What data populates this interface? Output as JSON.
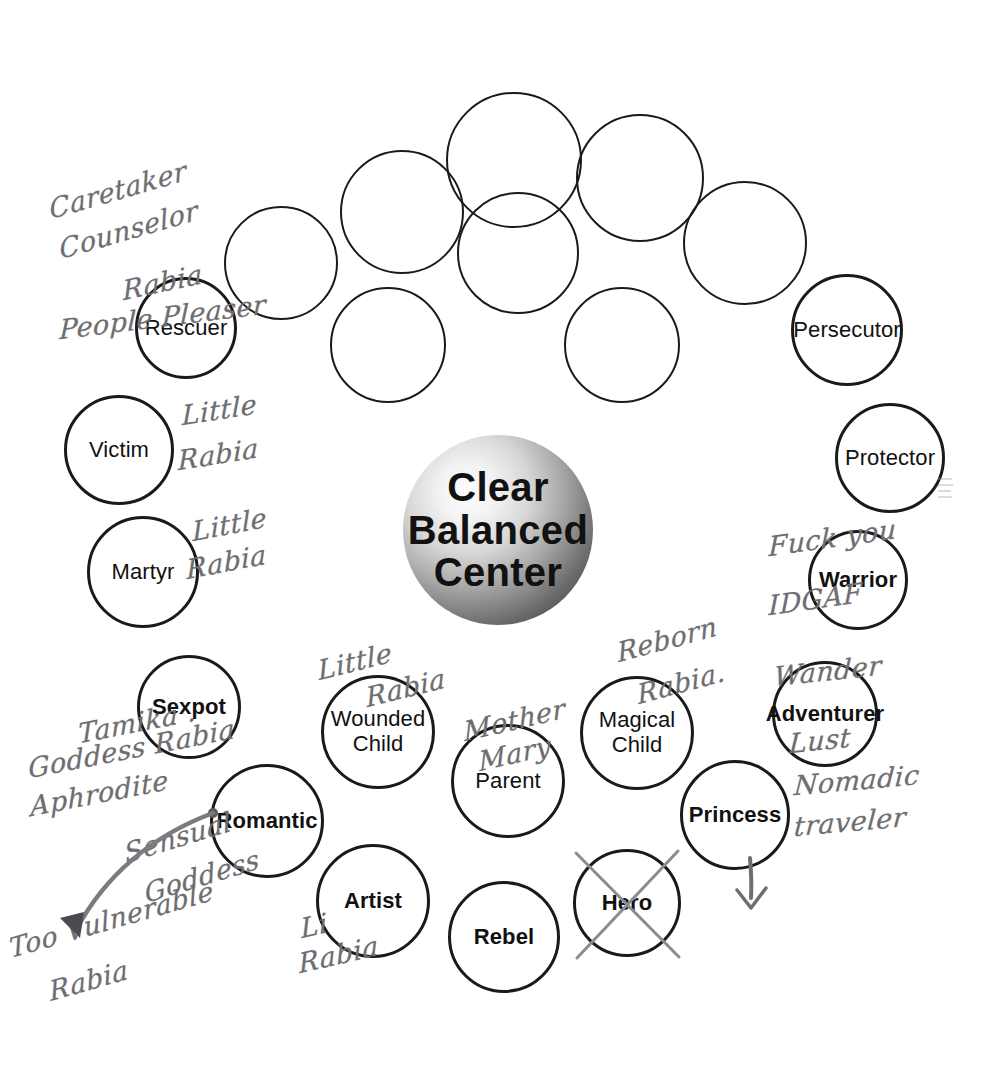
{
  "diagram": {
    "center": {
      "text": "Clear\nBalanced\nCenter"
    },
    "nodes": [
      {
        "id": "empty-1",
        "label": "",
        "style": "empty",
        "cx": 402,
        "cy": 212,
        "r": 62
      },
      {
        "id": "empty-2",
        "label": "",
        "style": "empty",
        "cx": 514,
        "cy": 160,
        "r": 68
      },
      {
        "id": "empty-3",
        "label": "",
        "style": "empty",
        "cx": 640,
        "cy": 178,
        "r": 64
      },
      {
        "id": "empty-4",
        "label": "",
        "style": "empty",
        "cx": 745,
        "cy": 243,
        "r": 62
      },
      {
        "id": "empty-5",
        "label": "",
        "style": "empty",
        "cx": 281,
        "cy": 263,
        "r": 57
      },
      {
        "id": "empty-6",
        "label": "",
        "style": "empty",
        "cx": 518,
        "cy": 253,
        "r": 61
      },
      {
        "id": "empty-7",
        "label": "",
        "style": "empty",
        "cx": 388,
        "cy": 345,
        "r": 58
      },
      {
        "id": "empty-8",
        "label": "",
        "style": "empty",
        "cx": 622,
        "cy": 345,
        "r": 58
      },
      {
        "id": "rescuer",
        "label": "Rescuer",
        "style": "regular",
        "cx": 186,
        "cy": 328,
        "r": 51
      },
      {
        "id": "victim",
        "label": "Victim",
        "style": "regular",
        "cx": 119,
        "cy": 450,
        "r": 55
      },
      {
        "id": "martyr",
        "label": "Martyr",
        "style": "regular",
        "cx": 143,
        "cy": 572,
        "r": 56
      },
      {
        "id": "persecutor",
        "label": "Persecutor",
        "style": "regular",
        "cx": 847,
        "cy": 330,
        "r": 56
      },
      {
        "id": "protector",
        "label": "Protector",
        "style": "regular",
        "cx": 890,
        "cy": 458,
        "r": 55
      },
      {
        "id": "warrior",
        "label": "Warrior",
        "style": "bold",
        "cx": 858,
        "cy": 580,
        "r": 50
      },
      {
        "id": "sexpot",
        "label": "Sexpot",
        "style": "bold",
        "cx": 189,
        "cy": 707,
        "r": 52
      },
      {
        "id": "romantic",
        "label": "Romantic",
        "style": "bold",
        "cx": 267,
        "cy": 821,
        "r": 57
      },
      {
        "id": "wounded-child",
        "label": "Wounded\nChild",
        "style": "regular",
        "cx": 378,
        "cy": 732,
        "r": 57
      },
      {
        "id": "parent",
        "label": "Parent",
        "style": "regular",
        "cx": 508,
        "cy": 781,
        "r": 57
      },
      {
        "id": "magical-child",
        "label": "Magical\nChild",
        "style": "regular",
        "cx": 637,
        "cy": 733,
        "r": 57
      },
      {
        "id": "adventurer",
        "label": "Adventurer",
        "style": "bold",
        "cx": 825,
        "cy": 714,
        "r": 53
      },
      {
        "id": "princess",
        "label": "Princess",
        "style": "bold",
        "cx": 735,
        "cy": 815,
        "r": 55
      },
      {
        "id": "artist",
        "label": "Artist",
        "style": "bold",
        "cx": 373,
        "cy": 901,
        "r": 57
      },
      {
        "id": "rebel",
        "label": "Rebel",
        "style": "bold",
        "cx": 504,
        "cy": 937,
        "r": 56
      },
      {
        "id": "hero",
        "label": "Hero",
        "style": "bold",
        "cx": 627,
        "cy": 903,
        "r": 54,
        "crossed_out": true
      }
    ],
    "annotations": [
      {
        "id": "note-caretaker",
        "text": "Caretaker",
        "x": 48,
        "y": 196,
        "rotate": -16,
        "size": "big"
      },
      {
        "id": "note-counselor",
        "text": "Counselor",
        "x": 58,
        "y": 236,
        "rotate": -16,
        "size": "big"
      },
      {
        "id": "note-rabia-rescuer",
        "text": "Rabia",
        "x": 122,
        "y": 277,
        "rotate": -12,
        "size": "big"
      },
      {
        "id": "note-people-pleaser",
        "text": "People Pleaser",
        "x": 60,
        "y": 316,
        "rotate": -7,
        "size": "big"
      },
      {
        "id": "note-little-victim",
        "text": "Little",
        "x": 182,
        "y": 402,
        "rotate": -9,
        "size": "big"
      },
      {
        "id": "note-rabia-victim",
        "text": "Rabia",
        "x": 178,
        "y": 447,
        "rotate": -9,
        "size": "big"
      },
      {
        "id": "note-little-martyr",
        "text": "Little",
        "x": 192,
        "y": 518,
        "rotate": -11,
        "size": "big"
      },
      {
        "id": "note-rabia-martyr",
        "text": "Rabia",
        "x": 186,
        "y": 556,
        "rotate": -11,
        "size": "big"
      },
      {
        "id": "note-fuck-you",
        "text": "Fuck you",
        "x": 769,
        "y": 533,
        "rotate": -8,
        "size": "big"
      },
      {
        "id": "note-idgaf",
        "text": "IDGAF",
        "x": 769,
        "y": 592,
        "rotate": -8,
        "size": "big"
      },
      {
        "id": "note-wander",
        "text": "Wander",
        "x": 775,
        "y": 663,
        "rotate": -6,
        "size": "big"
      },
      {
        "id": "note-lust",
        "text": "Lust",
        "x": 790,
        "y": 730,
        "rotate": -6,
        "size": "big"
      },
      {
        "id": "note-nomadic",
        "text": "Nomadic",
        "x": 795,
        "y": 772,
        "rotate": -5,
        "size": "big"
      },
      {
        "id": "note-traveler",
        "text": "traveler",
        "x": 795,
        "y": 813,
        "rotate": -5,
        "size": "big"
      },
      {
        "id": "note-reborn",
        "text": "Reborn",
        "x": 616,
        "y": 639,
        "rotate": -15,
        "size": "big"
      },
      {
        "id": "note-rabia-magical",
        "text": "Rabia.",
        "x": 636,
        "y": 681,
        "rotate": -15,
        "size": "big"
      },
      {
        "id": "note-little-wounded",
        "text": "Little",
        "x": 317,
        "y": 657,
        "rotate": -14,
        "size": "big"
      },
      {
        "id": "note-rabia-wounded",
        "text": "Rabia",
        "x": 365,
        "y": 684,
        "rotate": -14,
        "size": "big"
      },
      {
        "id": "note-mother",
        "text": "Mother",
        "x": 463,
        "y": 718,
        "rotate": -13,
        "size": "big"
      },
      {
        "id": "note-mary",
        "text": "Mary",
        "x": 478,
        "y": 748,
        "rotate": -13,
        "size": "big"
      },
      {
        "id": "note-tamika",
        "text": "Tamika .",
        "x": 78,
        "y": 720,
        "rotate": -11,
        "size": "big"
      },
      {
        "id": "note-goddess-rabia",
        "text": "Goddess Rabia",
        "x": 28,
        "y": 755,
        "rotate": -11,
        "size": "big"
      },
      {
        "id": "note-aphrodite",
        "text": "Aphrodite",
        "x": 30,
        "y": 793,
        "rotate": -11,
        "size": "big"
      },
      {
        "id": "note-sensual",
        "text": "Sensual",
        "x": 123,
        "y": 840,
        "rotate": -17,
        "size": "big"
      },
      {
        "id": "note-goddess",
        "text": "Goddess",
        "x": 143,
        "y": 880,
        "rotate": -17,
        "size": "big"
      },
      {
        "id": "note-vulnerable",
        "text": "Too Vulnerable",
        "x": 8,
        "y": 935,
        "rotate": -16,
        "size": "big"
      },
      {
        "id": "note-rabia-vulnerable",
        "text": "Rabia",
        "x": 48,
        "y": 978,
        "rotate": -16,
        "size": "big"
      },
      {
        "id": "note-little-artist",
        "text": "Li",
        "x": 300,
        "y": 915,
        "rotate": -13,
        "size": "big"
      },
      {
        "id": "note-rabia-artist",
        "text": "Rabia",
        "x": 298,
        "y": 950,
        "rotate": -13,
        "size": "big"
      }
    ],
    "marks": {
      "hero_crossout": "x-strike",
      "princess_arrow": "down-arrow",
      "romantic_arrow": "curved-arrow-to-lower-left"
    },
    "colors": {
      "ink": "#1a1a1a",
      "handwriting": "#6e6e72",
      "center_dark": "#3a3a3a",
      "center_light": "#fdfdfd",
      "background": "#ffffff"
    }
  }
}
